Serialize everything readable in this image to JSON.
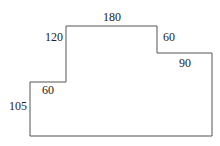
{
  "figure": {
    "type": "rectilinear-polygon",
    "stroke_color": "#555555",
    "label_color": "#222222",
    "vertices": [
      [
        30,
        82
      ],
      [
        66,
        82
      ],
      [
        66,
        26
      ],
      [
        157,
        26
      ],
      [
        157,
        53
      ],
      [
        212,
        53
      ],
      [
        212,
        136
      ],
      [
        30,
        136
      ]
    ],
    "labels": {
      "top_width": "180",
      "upper_left_height": "120",
      "right_step_height": "60",
      "right_step_width": "90",
      "left_step_width": "60",
      "left_height": "105"
    }
  }
}
